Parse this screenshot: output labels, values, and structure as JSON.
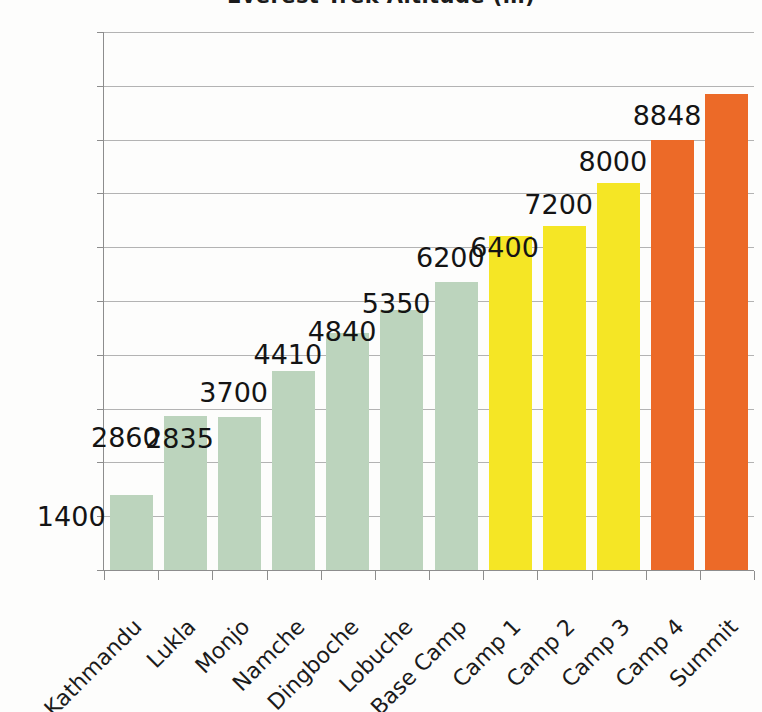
{
  "chart_data": {
    "type": "bar",
    "title": "Everest Trek Altitude (m)",
    "xlabel": "",
    "ylabel": "",
    "ylim": [
      0,
      10000
    ],
    "ytick_labels": [
      "0",
      "1000",
      "2000",
      "3000",
      "4000",
      "5000",
      "6000",
      "7000",
      "8000",
      "9000",
      "10000"
    ],
    "ytick_values": [
      0,
      1000,
      2000,
      3000,
      4000,
      5000,
      6000,
      7000,
      8000,
      9000,
      10000
    ],
    "grid": true,
    "legend": "none",
    "categories": [
      "Kathmandu",
      "Lukla",
      "Monjo",
      "Namche",
      "Dingboche",
      "Lobuche",
      "Base Camp",
      "Camp 1",
      "Camp 2",
      "Camp 3",
      "Camp 4",
      "Summit"
    ],
    "values": [
      1400,
      2860,
      2835,
      3700,
      4410,
      4840,
      5350,
      6200,
      6400,
      7200,
      8000,
      8848
    ],
    "value_labels": [
      "1400",
      "2860",
      "2835",
      "3700",
      "4410",
      "4840",
      "5350",
      "6200",
      "6400",
      "7200",
      "8000",
      "8848"
    ],
    "bar_colors": [
      "#bcd4bd",
      "#bcd4bd",
      "#bcd4bd",
      "#bcd4bd",
      "#bcd4bd",
      "#bcd4bd",
      "#bcd4bd",
      "#f5e625",
      "#f5e625",
      "#f5e625",
      "#ec6a28",
      "#ec6a28"
    ]
  },
  "colors": {
    "green": "#bcd4bd",
    "yellow": "#f5e625",
    "orange": "#ec6a28",
    "gridline": "#b3b3b3",
    "axis": "#8d8d8d",
    "text": "#1b1b1b",
    "background": "#fdfdfc"
  }
}
